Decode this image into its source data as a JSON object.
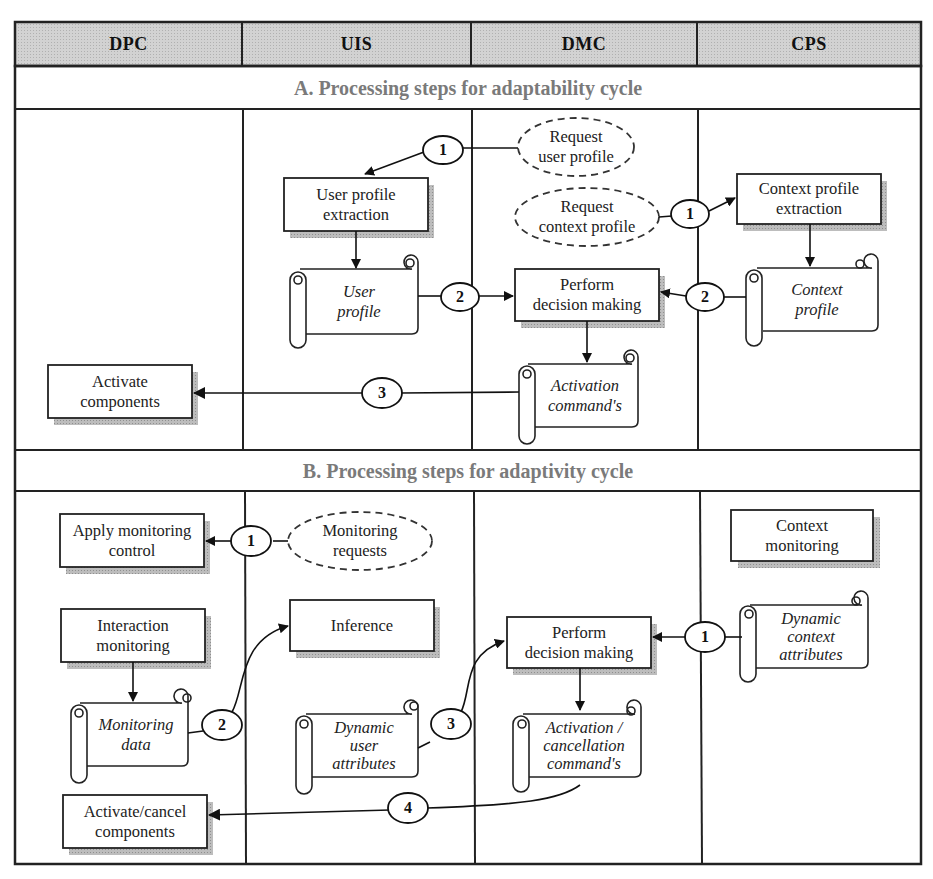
{
  "lanes": {
    "headers": [
      "DPC",
      "UIS",
      "DMC",
      "CPS"
    ],
    "header_fill": "#cfcfcf"
  },
  "section_a": {
    "title": "A. Processing steps for adaptability cycle",
    "processes": {
      "user_profile_extraction": "User profile\nextraction",
      "context_profile_extraction": "Context profile\nextraction",
      "perform_decision_making": "Perform\ndecision making",
      "activate_components": "Activate\ncomponents"
    },
    "documents": {
      "user_profile": "User\nprofile",
      "context_profile": "Context\nprofile",
      "activation_commands": "Activation\ncommand's"
    },
    "requests": {
      "request_user_profile": "Request\nuser profile",
      "request_context_profile": "Request\ncontext profile"
    },
    "steps": {
      "step1_user": "1",
      "step1_context": "1",
      "step2_user": "2",
      "step2_context": "2",
      "step3": "3"
    }
  },
  "section_b": {
    "title": "B. Processing steps for adaptivity cycle",
    "processes": {
      "apply_monitoring_control": "Apply monitoring\ncontrol",
      "interaction_monitoring": "Interaction\nmonitoring",
      "inference": "Inference",
      "perform_decision_making": "Perform\ndecision making",
      "context_monitoring": "Context\nmonitoring",
      "activate_cancel_components": "Activate/cancel\ncomponents"
    },
    "documents": {
      "monitoring_data": "Monitoring\ndata",
      "dynamic_user_attributes": "Dynamic\nuser\nattributes",
      "dynamic_context_attributes": "Dynamic\ncontext\nattributes",
      "activation_cancellation_commands": "Activation /\ncancellation\ncommand's"
    },
    "requests": {
      "monitoring_requests": "Monitoring\nrequests"
    },
    "steps": {
      "step1_monitoring": "1",
      "step1_context": "1",
      "step2": "2",
      "step3": "3",
      "step4": "4"
    }
  }
}
